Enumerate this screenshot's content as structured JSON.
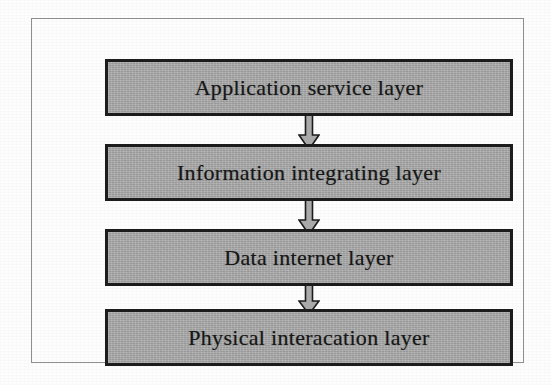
{
  "diagram": {
    "type": "layered-architecture",
    "orientation": "vertical-top-down",
    "frame": {
      "border_color": "#8f8f8f",
      "background": "#ffffff"
    },
    "style": {
      "box_fill": "#a9a9a9",
      "box_border": "#1c1c1c",
      "text_color": "#171717",
      "arrow_fill": "#a9a9a9",
      "arrow_border": "#1c1c1c"
    },
    "layers": [
      {
        "id": "application-service",
        "label": "Application service layer"
      },
      {
        "id": "information-integrating",
        "label": "Information integrating layer"
      },
      {
        "id": "data-internet",
        "label": "Data internet layer"
      },
      {
        "id": "physical-interacation",
        "label": "Physical interacation layer"
      }
    ],
    "connectors": [
      {
        "id": "arrow-1",
        "from": "application-service",
        "to": "information-integrating",
        "shape": "block-arrow-down"
      },
      {
        "id": "arrow-2",
        "from": "information-integrating",
        "to": "data-internet",
        "shape": "block-arrow-down"
      },
      {
        "id": "arrow-3",
        "from": "data-internet",
        "to": "physical-interacation",
        "shape": "block-arrow-down"
      }
    ]
  }
}
